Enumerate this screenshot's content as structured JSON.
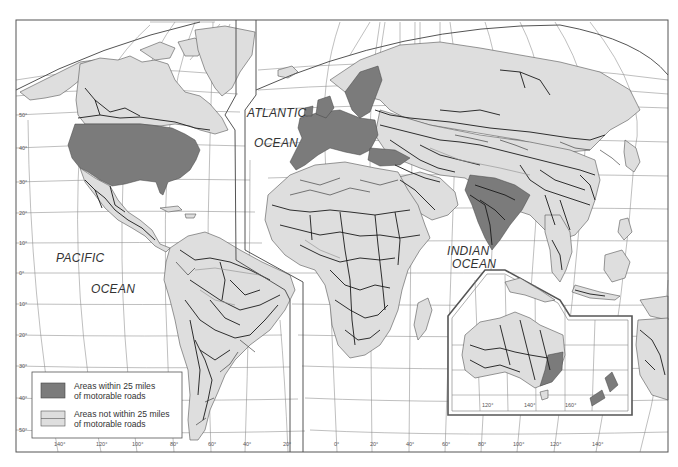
{
  "map": {
    "title_visible": false,
    "ocean_labels": {
      "atlantic_line1": "ATLANTIC",
      "atlantic_line2": "OCEAN",
      "pacific_line1": "PACIFIC",
      "pacific_line2": "OCEAN",
      "indian_line1": "INDIAN",
      "indian_line2": "OCEAN"
    },
    "latitude_ticks": [
      "50°",
      "40°",
      "30°",
      "20°",
      "10°",
      "0°",
      "10°",
      "20°",
      "30°",
      "40°",
      "50°"
    ],
    "longitude_ticks_west_lobe": [
      "140°",
      "120°",
      "100°",
      "80°",
      "60°",
      "40°",
      "20°"
    ],
    "longitude_ticks_east_lobe": [
      "0°",
      "20°",
      "40°",
      "60°",
      "80°",
      "100°",
      "120°",
      "140°"
    ],
    "inset_australia": {
      "longitude_ticks": [
        "120°",
        "140°",
        "160°"
      ]
    },
    "legend": {
      "items": [
        {
          "line1": "Areas within 25 miles",
          "line2": "of motorable roads",
          "swatch_color": "#7b7b7b"
        },
        {
          "line1": "Areas not within 25 miles",
          "line2": "of motorable roads",
          "swatch_color": "#dedede"
        }
      ]
    },
    "colors": {
      "ocean": "#ffffff",
      "land_remote": "#dedede",
      "land_within_25mi": "#7b7b7b",
      "roads": "#1a1a1a",
      "graticule": "#8a8a8a",
      "frame": "#555555"
    }
  }
}
